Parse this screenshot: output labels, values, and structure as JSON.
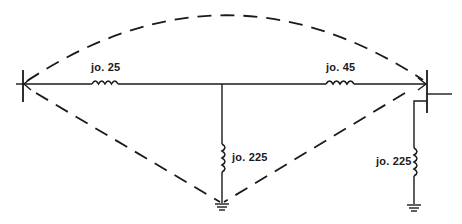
{
  "diagram": {
    "type": "circuit-reactance-network",
    "colors": {
      "line": "#1a1a1a",
      "background": "#ffffff"
    },
    "nodes": [
      {
        "id": "left-bus",
        "symbol": "vertical-bar-with-arrow"
      },
      {
        "id": "center-junction",
        "symbol": "junction"
      },
      {
        "id": "right-bus",
        "symbol": "vertical-bar-with-arrow-and-stub"
      },
      {
        "id": "center-ground",
        "symbol": "ground-icon"
      },
      {
        "id": "right-ground",
        "symbol": "ground-icon"
      }
    ],
    "elements": [
      {
        "id": "series-left",
        "kind": "inductor",
        "label": "jo. 25",
        "from": "left-bus",
        "to": "center-junction"
      },
      {
        "id": "series-right",
        "kind": "inductor",
        "label": "jo. 45",
        "from": "center-junction",
        "to": "right-bus"
      },
      {
        "id": "shunt-center",
        "kind": "inductor",
        "label": "jo. 225",
        "from": "center-junction",
        "to": "center-ground"
      },
      {
        "id": "shunt-right",
        "kind": "inductor",
        "label": "jo. 225",
        "from": "right-bus",
        "to": "right-ground"
      }
    ],
    "dashed_paths": [
      {
        "id": "arc-top",
        "from": "left-bus",
        "to": "right-bus",
        "shape": "arc"
      },
      {
        "id": "diag-left",
        "from": "left-bus",
        "to": "center-ground",
        "shape": "line"
      },
      {
        "id": "diag-right",
        "from": "right-bus",
        "to": "center-ground",
        "shape": "line"
      }
    ],
    "labels": {
      "series_left": "jo. 25",
      "series_right": "jo. 45",
      "shunt_center": "jo. 225",
      "shunt_right": "jo. 225"
    }
  }
}
